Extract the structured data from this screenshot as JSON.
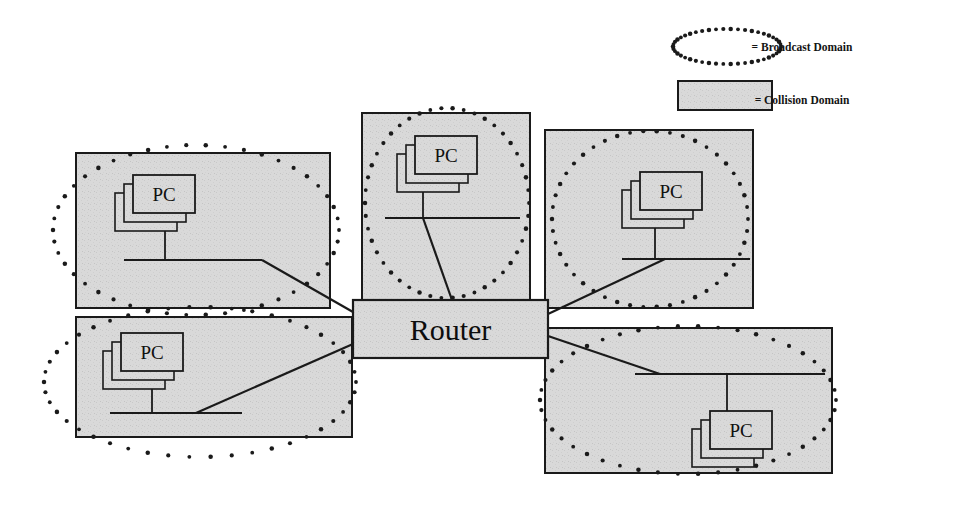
{
  "figure": {
    "kind": "network-topology-diagram",
    "background_color": "#ffffff",
    "collision_fill_color": "#d9d9d9",
    "stroke_color": "#1a1a1a",
    "router": {
      "label": "Router",
      "x": 353,
      "y": 300,
      "width": 195,
      "height": 58
    },
    "legend": {
      "items": [
        {
          "symbol": "dotted-ellipse",
          "label": "= Broadcast Domain",
          "shape_x": 673,
          "shape_y": 29,
          "shape_width": 108,
          "shape_height": 35,
          "label_x": 802,
          "label_y": 51
        },
        {
          "symbol": "gray-rectangle",
          "label": "= Collision Domain",
          "shape_x": 678,
          "shape_y": 81,
          "shape_width": 94,
          "shape_height": 29,
          "label_x": 802,
          "label_y": 104
        }
      ]
    },
    "segments": [
      {
        "id": "top-left",
        "pc_label": "PC",
        "box": {
          "x": 76,
          "y": 153,
          "width": 254,
          "height": 155
        },
        "ellipse": {
          "cx": 196,
          "cy": 230,
          "rx": 143,
          "ry": 85
        },
        "pc": {
          "x": 133,
          "y": 175,
          "width": 62,
          "height": 38
        },
        "bus": {
          "x1": 124,
          "y1": 260,
          "x2": 262,
          "y2": 260
        },
        "drop": {
          "x": 165,
          "y1": 222,
          "y2": 260
        },
        "link": {
          "x1": 262,
          "y1": 260,
          "x2": 353,
          "y2": 312
        }
      },
      {
        "id": "bottom-left",
        "pc_label": "PC",
        "box": {
          "x": 76,
          "y": 317,
          "width": 276,
          "height": 120
        },
        "ellipse": {
          "cx": 200,
          "cy": 382,
          "rx": 156,
          "ry": 75
        },
        "pc": {
          "x": 121,
          "y": 333,
          "width": 62,
          "height": 38
        },
        "bus": {
          "x1": 110,
          "y1": 413,
          "x2": 242,
          "y2": 413
        },
        "drop": {
          "x": 152,
          "y1": 380,
          "y2": 413
        },
        "link": {
          "x1": 196,
          "y1": 413,
          "x2": 353,
          "y2": 344
        }
      },
      {
        "id": "top-center",
        "pc_label": "PC",
        "box": {
          "x": 362,
          "y": 113,
          "width": 168,
          "height": 187
        },
        "ellipse": {
          "cx": 447,
          "cy": 203,
          "rx": 82,
          "ry": 95
        },
        "pc": {
          "x": 415,
          "y": 136,
          "width": 62,
          "height": 38
        },
        "bus": {
          "x1": 385,
          "y1": 218,
          "x2": 520,
          "y2": 218
        },
        "drop": {
          "x": 423,
          "y1": 183,
          "y2": 218
        },
        "link": {
          "x1": 423,
          "y1": 218,
          "x2": 452,
          "y2": 300
        }
      },
      {
        "id": "top-right",
        "pc_label": "PC",
        "box": {
          "x": 545,
          "y": 130,
          "width": 208,
          "height": 178
        },
        "ellipse": {
          "cx": 650,
          "cy": 219,
          "rx": 98,
          "ry": 88
        },
        "pc": {
          "x": 640,
          "y": 172,
          "width": 62,
          "height": 38
        },
        "bus": {
          "x1": 622,
          "y1": 259,
          "x2": 750,
          "y2": 259
        },
        "drop": {
          "x": 655,
          "y1": 220,
          "y2": 259
        },
        "link": {
          "x1": 665,
          "y1": 259,
          "x2": 548,
          "y2": 314
        }
      },
      {
        "id": "bottom-right",
        "pc_label": "PC",
        "box": {
          "x": 545,
          "y": 328,
          "width": 287,
          "height": 145
        },
        "ellipse": {
          "cx": 688,
          "cy": 400,
          "rx": 148,
          "ry": 74
        },
        "pc": {
          "x": 710,
          "y": 411,
          "width": 62,
          "height": 38
        },
        "bus": {
          "x1": 635,
          "y1": 374,
          "x2": 825,
          "y2": 374
        },
        "drop": {
          "x": 727,
          "y1": 374,
          "y2": 411
        },
        "link": {
          "x1": 660,
          "y1": 374,
          "x2": 548,
          "y2": 336
        }
      }
    ]
  }
}
